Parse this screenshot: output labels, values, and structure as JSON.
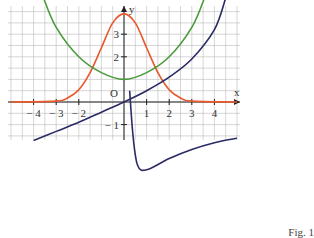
{
  "chart_data": {
    "type": "line",
    "title": "",
    "caption": "Fig. 1",
    "xlabel": "x",
    "ylabel": "y",
    "origin_label": "O",
    "xlim": [
      -5.2,
      5
    ],
    "ylim": [
      -3.4,
      4.6
    ],
    "grid": true,
    "grid_step": 0.5,
    "x_ticks": [
      -4,
      -3,
      -2,
      1,
      2,
      3,
      4
    ],
    "x_tick_labels": [
      "− 4",
      "− 3",
      "− 2",
      "1",
      "2",
      "3",
      "4"
    ],
    "y_ticks": [
      3,
      2,
      -1
    ],
    "y_tick_labels": [
      "3",
      "2",
      "− 1"
    ],
    "series": [
      {
        "name": "orange bell curve",
        "color": "#e8582a",
        "x": [
          -5,
          -3,
          -2.5,
          -2,
          -1.5,
          -1,
          -0.5,
          0,
          0.5,
          1,
          1.5,
          2,
          2.5,
          3,
          5
        ],
        "y": [
          0,
          0.04,
          0.18,
          0.54,
          1.3,
          2.4,
          3.5,
          3.9,
          3.5,
          2.4,
          1.3,
          0.54,
          0.18,
          0.04,
          0
        ]
      },
      {
        "name": "green U curve",
        "color": "#4a9a3c",
        "x": [
          -3.6,
          -3,
          -2,
          -1,
          0,
          1,
          2,
          3,
          3.6
        ],
        "y": [
          4.7,
          3.3,
          2.0,
          1.3,
          1.0,
          1.3,
          2.0,
          3.3,
          4.7
        ]
      },
      {
        "name": "navy increasing curve",
        "color": "#2a2a66",
        "x": [
          -4,
          -3,
          -2,
          -1,
          0,
          1,
          2,
          3,
          4,
          4.5
        ],
        "y": [
          -1.7,
          -1.3,
          -0.9,
          -0.45,
          0,
          0.5,
          1.1,
          1.9,
          3.2,
          4.6
        ]
      },
      {
        "name": "navy lower branch",
        "color": "#2a2a66",
        "x": [
          0.25,
          0.4,
          0.6,
          1,
          2,
          3,
          4,
          5
        ],
        "y": [
          0.5,
          -1.5,
          -2.8,
          -3.0,
          -2.5,
          -2.1,
          -1.8,
          -1.6
        ]
      }
    ]
  }
}
